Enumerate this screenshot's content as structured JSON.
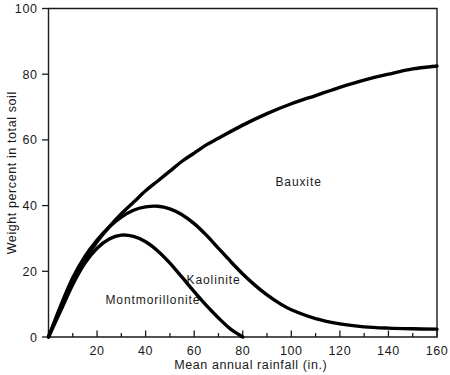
{
  "chart_data": {
    "type": "line",
    "title": "",
    "xlabel": "Mean annual rainfall (in.)",
    "ylabel": "Weight percent in total soil",
    "xlim": [
      0,
      160
    ],
    "ylim": [
      0,
      100
    ],
    "xticks": [
      0,
      20,
      40,
      60,
      80,
      100,
      120,
      140,
      160
    ],
    "xtick_labels": [
      "",
      "20",
      "40",
      "60",
      "80",
      "100",
      "120",
      "140",
      "160"
    ],
    "yticks": [
      0,
      20,
      40,
      60,
      80,
      100
    ],
    "ytick_labels": [
      "0",
      "20",
      "40",
      "60",
      "80",
      "100"
    ],
    "xminor_step": 10,
    "grid": false,
    "legend": "inline-labels",
    "series": [
      {
        "name": "Montmorillonite",
        "label_x": 43,
        "label_y": 10,
        "x": [
          0,
          5,
          10,
          15,
          20,
          25,
          30,
          35,
          40,
          45,
          50,
          55,
          60,
          65,
          70,
          75,
          80
        ],
        "y": [
          0,
          8,
          16,
          22.5,
          27,
          29.8,
          31,
          30.6,
          29,
          26.2,
          22.5,
          18.2,
          13.8,
          9.6,
          5.8,
          2.4,
          0
        ]
      },
      {
        "name": "Kaolinite",
        "label_x": 68,
        "label_y": 16,
        "x": [
          0,
          5,
          10,
          15,
          20,
          25,
          30,
          35,
          40,
          45,
          50,
          55,
          60,
          65,
          70,
          75,
          80,
          85,
          90,
          95,
          100,
          110,
          120,
          130,
          140,
          150,
          160
        ],
        "y": [
          0,
          9.5,
          18,
          24.5,
          29.5,
          33.5,
          36.5,
          38.6,
          39.6,
          39.8,
          39.0,
          37.2,
          34.5,
          31.0,
          27.0,
          23.0,
          19.2,
          15.8,
          12.8,
          10.3,
          8.3,
          5.6,
          4.0,
          3.1,
          2.7,
          2.5,
          2.4
        ]
      },
      {
        "name": "Bauxite",
        "label_x": 103,
        "label_y": 46,
        "x": [
          0,
          5,
          10,
          15,
          20,
          25,
          30,
          35,
          40,
          45,
          50,
          55,
          60,
          65,
          70,
          80,
          90,
          100,
          110,
          120,
          130,
          140,
          150,
          160
        ],
        "y": [
          0,
          9,
          17,
          23.5,
          29,
          33.5,
          37.5,
          41,
          44.5,
          47.5,
          50.5,
          53.5,
          56,
          58.5,
          60.5,
          64.5,
          68,
          71,
          73.5,
          76,
          78.2,
          80,
          81.6,
          82.5
        ]
      }
    ],
    "colors": {
      "curve": "#000000",
      "axis": "#1a1a1a",
      "background": "#ffffff"
    }
  }
}
